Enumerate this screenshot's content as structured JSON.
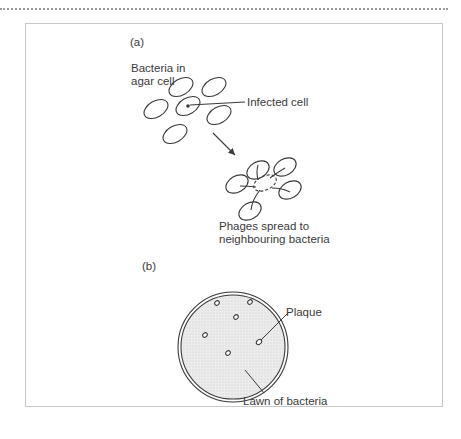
{
  "figure": {
    "panel_a": {
      "label": "(a)",
      "bacteria_label_line1": "Bacteria in",
      "bacteria_label_line2": "agar cell",
      "infected_label": "Infected cell",
      "spread_label_line1": "Phages spread to",
      "spread_label_line2": "neighbouring bacteria"
    },
    "panel_b": {
      "label": "(b)",
      "plaque_label": "Plaque",
      "lawn_label": "Lawn of bacteria"
    },
    "colors": {
      "stroke": "#3a3a3a",
      "dish_fill": "#e4e4e4",
      "frame": "#c8c8c8"
    }
  }
}
